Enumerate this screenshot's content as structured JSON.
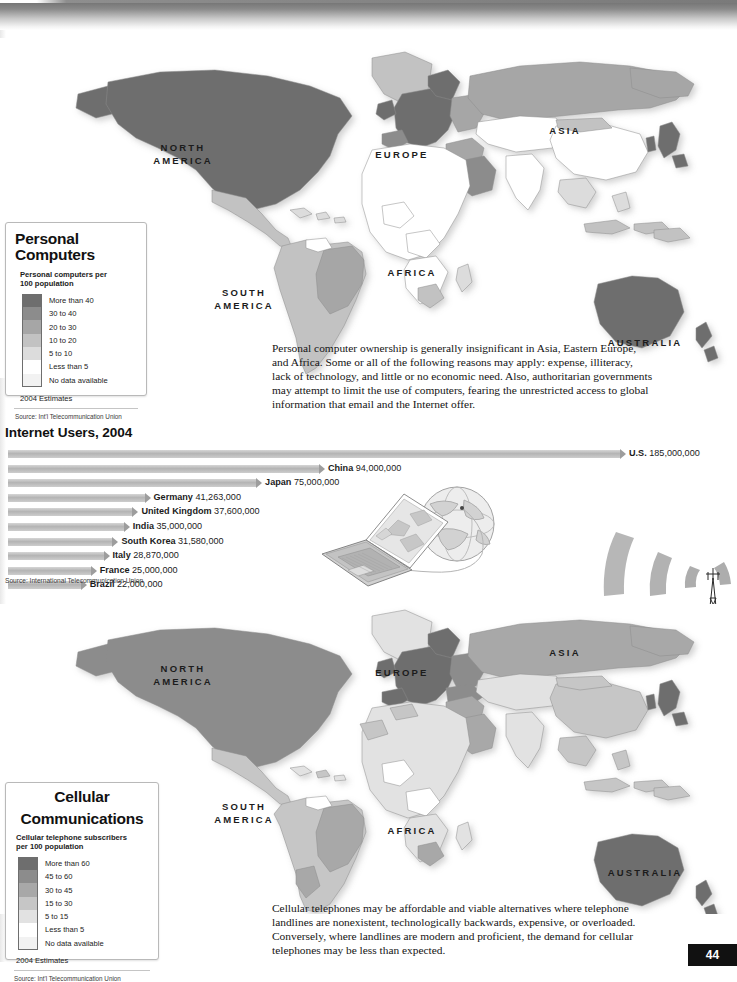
{
  "page": {
    "number": "44"
  },
  "maps": {
    "top": {
      "name": "personal-computers-map",
      "continent_labels": [
        "NORTH AMERICA",
        "SOUTH AMERICA",
        "EUROPE",
        "AFRICA",
        "ASIA",
        "AUSTRALIA"
      ]
    },
    "bottom": {
      "name": "cellular-communications-map",
      "continent_labels": [
        "NORTH AMERICA",
        "SOUTH AMERICA",
        "EUROPE",
        "AFRICA",
        "ASIA",
        "AUSTRALIA"
      ]
    }
  },
  "legend_pc": {
    "title": "Personal Computers",
    "subtitle": "Personal computers per\n100 population",
    "items": [
      {
        "label": "More than 40",
        "color": "#6e6e6e"
      },
      {
        "label": "30 to 40",
        "color": "#8c8c8c"
      },
      {
        "label": "20 to 30",
        "color": "#a6a6a6"
      },
      {
        "label": "10 to 20",
        "color": "#c2c2c2"
      },
      {
        "label": "5 to 10",
        "color": "#dcdcdc"
      },
      {
        "label": "Less than 5",
        "color": "#ffffff"
      },
      {
        "label": "No data available",
        "color": "#f2f2f2"
      }
    ],
    "note": "2004 Estimates",
    "source": "Source: Int'l Telecommunication Union"
  },
  "legend_cell": {
    "title_line1": "Cellular",
    "title_line2": "Communications",
    "subtitle": "Cellular telephone subscribers\nper 100 population",
    "items": [
      {
        "label": "More than 60",
        "color": "#6e6e6e"
      },
      {
        "label": "45 to 60",
        "color": "#8c8c8c"
      },
      {
        "label": "30 to 45",
        "color": "#a8a8a8"
      },
      {
        "label": "15 to 30",
        "color": "#c6c6c6"
      },
      {
        "label": "5 to 15",
        "color": "#e2e2e2"
      },
      {
        "label": "Less than 5",
        "color": "#ffffff"
      },
      {
        "label": "No data available",
        "color": "#f2f2f2"
      }
    ],
    "note": "2004 Estimates",
    "source": "Source: Int'l Telecommunication Union"
  },
  "text_pc": "Personal computer ownership is generally insignificant in Asia, Eastern Europe, and Africa. Some or all of the following reasons may apply: expense, illiteracy, lack of technology, and little or no economic need. Also, authoritarian governments may attempt to limit the use of computers, fearing the unrestricted access to global information that email and the Internet offer.",
  "text_cell": "Cellular telephones may be affordable and viable alternatives where telephone landlines are nonexistent, technologically backwards, expensive, or overloaded. Conversely, where landlines are modern and proficient, the demand for cellular telephones may be less than expected.",
  "chart_data": {
    "type": "bar",
    "orientation": "horizontal",
    "title": "Internet Users, 2004",
    "source": "Source: International Telecommunication Union",
    "xlabel": "",
    "ylabel": "",
    "grid": false,
    "legend": "none",
    "xlim": [
      0,
      185000000
    ],
    "categories": [
      "U.S.",
      "China",
      "Japan",
      "Germany",
      "United Kingdom",
      "India",
      "South Korea",
      "Italy",
      "France",
      "Brazil"
    ],
    "values": [
      185000000,
      94000000,
      75000000,
      41263000,
      37600000,
      35000000,
      31580000,
      28870000,
      25000000,
      22000000
    ],
    "value_labels": [
      "U.S. 185,000,000",
      "China 94,000,000",
      "Japan 75,000,000",
      "Germany 41,263,000",
      "United Kingdom 37,600,000",
      "India 35,000,000",
      "South Korea 31,580,000",
      "Italy 28,870,000",
      "France 25,000,000",
      "Brazil 22,000,000"
    ],
    "names": [
      "U.S.",
      "China",
      "Japan",
      "Germany",
      "United Kingdom",
      "India",
      "South Korea",
      "Italy",
      "France",
      "Brazil"
    ],
    "numbers": [
      "185,000,000",
      "94,000,000",
      "75,000,000",
      "41,263,000",
      "37,600,000",
      "35,000,000",
      "31,580,000",
      "28,870,000",
      "25,000,000",
      "22,000,000"
    ]
  },
  "illustrations": {
    "laptop_globe": "laptop-and-globe-illustration",
    "tower_waves": "cell-tower-with-signal-waves-illustration"
  }
}
